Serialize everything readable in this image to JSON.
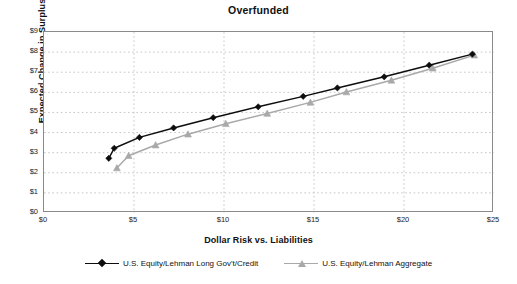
{
  "chart_data": {
    "type": "scatter",
    "title": "Overfunded",
    "xlabel": "Dollar Risk vs. Liabilities",
    "ylabel": "Expected Change in Surplus",
    "xlim": [
      0,
      25
    ],
    "ylim": [
      0,
      9
    ],
    "xticks": [
      "$0",
      "$5",
      "$10",
      "$15",
      "$20",
      "$25"
    ],
    "xtick_values": [
      0,
      5,
      10,
      15,
      20,
      25
    ],
    "yticks": [
      "$0",
      "$1",
      "$2",
      "$3",
      "$4",
      "$5",
      "$6",
      "$7",
      "$8",
      "$9"
    ],
    "ytick_values": [
      0,
      1,
      2,
      3,
      4,
      5,
      6,
      7,
      8,
      9
    ],
    "grid": "dotted-both",
    "legend_position": "bottom-center",
    "series": [
      {
        "name": "U.S. Equity/Lehman Long Gov't/Credit",
        "color": "#0d0d0d",
        "marker": "diamond",
        "points": [
          {
            "x": 3.6,
            "y": 2.72
          },
          {
            "x": 3.9,
            "y": 3.22
          },
          {
            "x": 5.3,
            "y": 3.76
          },
          {
            "x": 7.2,
            "y": 4.23
          },
          {
            "x": 9.4,
            "y": 4.74
          },
          {
            "x": 11.9,
            "y": 5.28
          },
          {
            "x": 14.4,
            "y": 5.8
          },
          {
            "x": 16.3,
            "y": 6.22
          },
          {
            "x": 18.9,
            "y": 6.77
          },
          {
            "x": 21.4,
            "y": 7.35
          },
          {
            "x": 23.8,
            "y": 7.9
          }
        ]
      },
      {
        "name": "U.S. Equity/Lehman Aggregate",
        "color": "#a9a9a9",
        "marker": "triangle",
        "points": [
          {
            "x": 4.05,
            "y": 2.24
          },
          {
            "x": 4.7,
            "y": 2.85
          },
          {
            "x": 6.2,
            "y": 3.38
          },
          {
            "x": 8.0,
            "y": 3.92
          },
          {
            "x": 10.1,
            "y": 4.44
          },
          {
            "x": 12.4,
            "y": 4.95
          },
          {
            "x": 14.8,
            "y": 5.5
          },
          {
            "x": 16.8,
            "y": 6.02
          },
          {
            "x": 19.3,
            "y": 6.6
          },
          {
            "x": 21.6,
            "y": 7.2
          },
          {
            "x": 23.9,
            "y": 7.85
          }
        ]
      }
    ]
  },
  "legend": {
    "items": [
      {
        "label": "U.S. Equity/Lehman Long Gov't/Credit",
        "marker": "diamond",
        "color": "#0d0d0d"
      },
      {
        "label": "U.S. Equity/Lehman Aggregate",
        "marker": "triangle",
        "color": "#a9a9a9"
      }
    ]
  }
}
